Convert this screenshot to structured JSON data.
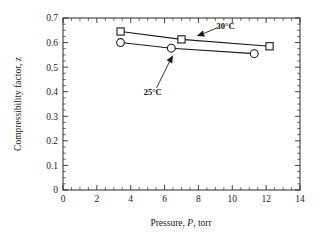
{
  "chart_data": {
    "type": "line",
    "title": "",
    "subtitle": "",
    "xlabel_parts": {
      "pre": "Pressure, ",
      "symbol": "P",
      "post": ", torr"
    },
    "xlabel": "Pressure, P, torr",
    "ylabel": "Compressibility factor, z",
    "xlim": [
      0,
      14
    ],
    "ylim": [
      0,
      0.7
    ],
    "x_major_step": 2,
    "x_minor_step": 0.5,
    "y_major_step": 0.1,
    "y_minor_step": 0.025,
    "xticks": [
      "0",
      "2",
      "4",
      "6",
      "8",
      "10",
      "12",
      "14"
    ],
    "xtick_values": [
      0,
      2,
      4,
      6,
      8,
      10,
      12,
      14
    ],
    "yticks": [
      "0",
      "0.1",
      "0.2",
      "0.3",
      "0.4",
      "0.5",
      "0.6",
      "0.7"
    ],
    "ytick_values": [
      0,
      0.1,
      0.2,
      0.3,
      0.4,
      0.5,
      0.6,
      0.7
    ],
    "grid": false,
    "legend_position": "inline-annotations",
    "frame": "box",
    "series": [
      {
        "name": "30°C",
        "marker": "square-open",
        "x": [
          3.4,
          7.0,
          12.2
        ],
        "values": [
          0.645,
          0.613,
          0.585
        ],
        "annotation": {
          "text": "30°C",
          "text_x": 9.6,
          "text_y": 0.668,
          "arrow_tip_x": 7.9,
          "arrow_tip_y": 0.627
        }
      },
      {
        "name": "25°C",
        "marker": "circle-open",
        "x": [
          3.4,
          6.4,
          11.3
        ],
        "values": [
          0.6,
          0.577,
          0.555
        ],
        "annotation": {
          "text": "25°C",
          "text_x": 5.3,
          "text_y": 0.398,
          "arrow_tip_x": 6.5,
          "arrow_tip_y": 0.548
        }
      }
    ],
    "colors": {
      "axis": "#2b2b2b",
      "line": "#1a1a1a",
      "marker_face": "#ffffff",
      "marker_edge": "#1a1a1a",
      "background": "#ffffff",
      "text": "#1a1a1a"
    }
  }
}
